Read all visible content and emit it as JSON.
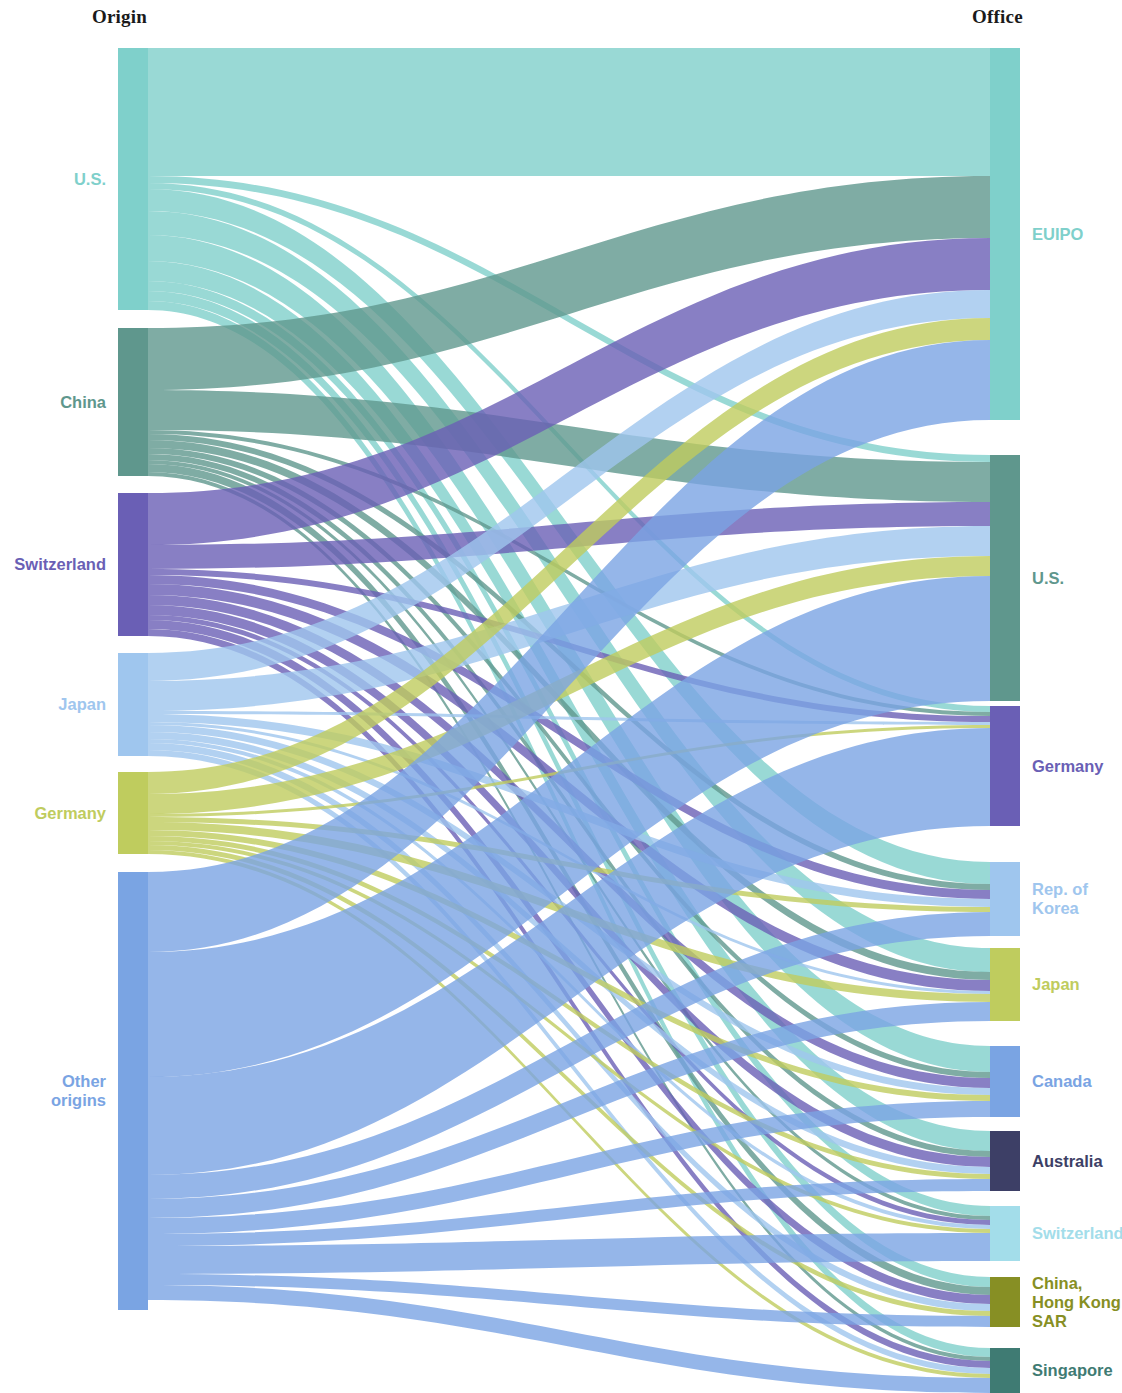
{
  "headers": {
    "left": "Origin",
    "right": "Office"
  },
  "palette": {
    "teal": "#7fd0cb",
    "green_teal": "#5f978d",
    "purple": "#6a5fb5",
    "light_blue": "#9fc6ee",
    "olive": "#bfcc5e",
    "cornflower": "#7aa4e3",
    "navy": "#3d3f66",
    "cyan_light": "#a3ddea",
    "dark_olive": "#878f24",
    "dark_teal": "#3f7b73"
  },
  "chart_data": {
    "type": "sankey",
    "title": "",
    "xlabel": "Origin",
    "ylabel": "Office",
    "legend": "none",
    "grid": false,
    "nodes_left": [
      {
        "id": "o_us",
        "label": "U.S.",
        "color": "#7fd0cb",
        "value": 262,
        "y0": 48,
        "y1": 310
      },
      {
        "id": "o_cn",
        "label": "China",
        "color": "#5f978d",
        "value": 148,
        "y0": 328,
        "y1": 476
      },
      {
        "id": "o_ch",
        "label": "Switzerland",
        "color": "#6a5fb5",
        "value": 143,
        "y0": 493,
        "y1": 636
      },
      {
        "id": "o_jp",
        "label": "Japan",
        "color": "#9fc6ee",
        "value": 103,
        "y0": 653,
        "y1": 756
      },
      {
        "id": "o_de",
        "label": "Germany",
        "color": "#bfcc5e",
        "value": 82,
        "y0": 772,
        "y1": 854
      },
      {
        "id": "o_other",
        "label": "Other\norigins",
        "color": "#7aa4e3",
        "value": 438,
        "y0": 872,
        "y1": 1310
      }
    ],
    "nodes_right": [
      {
        "id": "d_euipo",
        "label": "EUIPO",
        "color": "#7fd0cb",
        "value": 372,
        "y0": 48,
        "y1": 420
      },
      {
        "id": "d_us",
        "label": "U.S.",
        "color": "#5f978d",
        "value": 246,
        "y0": 455,
        "y1": 701
      },
      {
        "id": "d_de",
        "label": "Germany",
        "color": "#6a5fb5",
        "value": 120,
        "y0": 706,
        "y1": 826
      },
      {
        "id": "d_kr",
        "label": "Rep. of\nKorea",
        "color": "#9fc6ee",
        "value": 74,
        "y0": 862,
        "y1": 936
      },
      {
        "id": "d_jp",
        "label": "Japan",
        "color": "#bfcc5e",
        "value": 73,
        "y0": 948,
        "y1": 1021
      },
      {
        "id": "d_ca",
        "label": "Canada",
        "color": "#7aa4e3",
        "value": 71,
        "y0": 1046,
        "y1": 1117
      },
      {
        "id": "d_au",
        "label": "Australia",
        "color": "#3d3f66",
        "value": 60,
        "y0": 1131,
        "y1": 1191
      },
      {
        "id": "d_ch",
        "label": "Switzerland",
        "color": "#a3ddea",
        "value": 55,
        "y0": 1206,
        "y1": 1261
      },
      {
        "id": "d_hk",
        "label": "China,\nHong Kong\nSAR",
        "color": "#878f24",
        "value": 50,
        "y0": 1277,
        "y1": 1327
      },
      {
        "id": "d_sg",
        "label": "Singapore",
        "color": "#3f7b73",
        "value": 45,
        "y0": 1348,
        "y1": 1393
      }
    ],
    "links": [
      {
        "source": "o_us",
        "target": "d_euipo",
        "value": 128,
        "color": "#7fd0cb"
      },
      {
        "source": "o_us",
        "target": "d_us",
        "value": 7,
        "color": "#7fd0cb"
      },
      {
        "source": "o_us",
        "target": "d_de",
        "value": 6,
        "color": "#7fd0cb"
      },
      {
        "source": "o_us",
        "target": "d_kr",
        "value": 22,
        "color": "#7fd0cb"
      },
      {
        "source": "o_us",
        "target": "d_jp",
        "value": 24,
        "color": "#7fd0cb"
      },
      {
        "source": "o_us",
        "target": "d_ca",
        "value": 26,
        "color": "#7fd0cb"
      },
      {
        "source": "o_us",
        "target": "d_au",
        "value": 20,
        "color": "#7fd0cb"
      },
      {
        "source": "o_us",
        "target": "d_ch",
        "value": 10,
        "color": "#7fd0cb"
      },
      {
        "source": "o_us",
        "target": "d_hk",
        "value": 10,
        "color": "#7fd0cb"
      },
      {
        "source": "o_us",
        "target": "d_sg",
        "value": 9,
        "color": "#7fd0cb"
      },
      {
        "source": "o_cn",
        "target": "d_euipo",
        "value": 62,
        "color": "#5f978d"
      },
      {
        "source": "o_cn",
        "target": "d_us",
        "value": 40,
        "color": "#5f978d"
      },
      {
        "source": "o_cn",
        "target": "d_de",
        "value": 4,
        "color": "#5f978d"
      },
      {
        "source": "o_cn",
        "target": "d_kr",
        "value": 6,
        "color": "#5f978d"
      },
      {
        "source": "o_cn",
        "target": "d_jp",
        "value": 8,
        "color": "#5f978d"
      },
      {
        "source": "o_cn",
        "target": "d_ca",
        "value": 6,
        "color": "#5f978d"
      },
      {
        "source": "o_cn",
        "target": "d_au",
        "value": 6,
        "color": "#5f978d"
      },
      {
        "source": "o_cn",
        "target": "d_ch",
        "value": 4,
        "color": "#5f978d"
      },
      {
        "source": "o_cn",
        "target": "d_hk",
        "value": 8,
        "color": "#5f978d"
      },
      {
        "source": "o_cn",
        "target": "d_sg",
        "value": 4,
        "color": "#5f978d"
      },
      {
        "source": "o_ch",
        "target": "d_euipo",
        "value": 52,
        "color": "#6a5fb5"
      },
      {
        "source": "o_ch",
        "target": "d_us",
        "value": 24,
        "color": "#6a5fb5"
      },
      {
        "source": "o_ch",
        "target": "d_de",
        "value": 6,
        "color": "#6a5fb5"
      },
      {
        "source": "o_ch",
        "target": "d_kr",
        "value": 9,
        "color": "#6a5fb5"
      },
      {
        "source": "o_ch",
        "target": "d_jp",
        "value": 11,
        "color": "#6a5fb5"
      },
      {
        "source": "o_ch",
        "target": "d_ca",
        "value": 10,
        "color": "#6a5fb5"
      },
      {
        "source": "o_ch",
        "target": "d_au",
        "value": 10,
        "color": "#6a5fb5"
      },
      {
        "source": "o_ch",
        "target": "d_ch",
        "value": 5,
        "color": "#6a5fb5"
      },
      {
        "source": "o_ch",
        "target": "d_hk",
        "value": 9,
        "color": "#6a5fb5"
      },
      {
        "source": "o_ch",
        "target": "d_sg",
        "value": 7,
        "color": "#6a5fb5"
      },
      {
        "source": "o_jp",
        "target": "d_euipo",
        "value": 28,
        "color": "#9fc6ee"
      },
      {
        "source": "o_jp",
        "target": "d_us",
        "value": 30,
        "color": "#9fc6ee"
      },
      {
        "source": "o_jp",
        "target": "d_de",
        "value": 3,
        "color": "#9fc6ee"
      },
      {
        "source": "o_jp",
        "target": "d_kr",
        "value": 8,
        "color": "#9fc6ee"
      },
      {
        "source": "o_jp",
        "target": "d_jp",
        "value": 3,
        "color": "#9fc6ee"
      },
      {
        "source": "o_jp",
        "target": "d_ca",
        "value": 7,
        "color": "#9fc6ee"
      },
      {
        "source": "o_jp",
        "target": "d_au",
        "value": 7,
        "color": "#9fc6ee"
      },
      {
        "source": "o_jp",
        "target": "d_ch",
        "value": 4,
        "color": "#9fc6ee"
      },
      {
        "source": "o_jp",
        "target": "d_hk",
        "value": 7,
        "color": "#9fc6ee"
      },
      {
        "source": "o_jp",
        "target": "d_sg",
        "value": 6,
        "color": "#9fc6ee"
      },
      {
        "source": "o_de",
        "target": "d_euipo",
        "value": 22,
        "color": "#bfcc5e"
      },
      {
        "source": "o_de",
        "target": "d_us",
        "value": 20,
        "color": "#bfcc5e"
      },
      {
        "source": "o_de",
        "target": "d_de",
        "value": 3,
        "color": "#bfcc5e"
      },
      {
        "source": "o_de",
        "target": "d_kr",
        "value": 5,
        "color": "#bfcc5e"
      },
      {
        "source": "o_de",
        "target": "d_jp",
        "value": 8,
        "color": "#bfcc5e"
      },
      {
        "source": "o_de",
        "target": "d_ca",
        "value": 6,
        "color": "#bfcc5e"
      },
      {
        "source": "o_de",
        "target": "d_au",
        "value": 5,
        "color": "#bfcc5e"
      },
      {
        "source": "o_de",
        "target": "d_ch",
        "value": 4,
        "color": "#bfcc5e"
      },
      {
        "source": "o_de",
        "target": "d_hk",
        "value": 5,
        "color": "#bfcc5e"
      },
      {
        "source": "o_de",
        "target": "d_sg",
        "value": 4,
        "color": "#bfcc5e"
      },
      {
        "source": "o_other",
        "target": "d_euipo",
        "value": 80,
        "color": "#7aa4e3"
      },
      {
        "source": "o_other",
        "target": "d_us",
        "value": 125,
        "color": "#7aa4e3"
      },
      {
        "source": "o_other",
        "target": "d_de",
        "value": 98,
        "color": "#7aa4e3"
      },
      {
        "source": "o_other",
        "target": "d_kr",
        "value": 24,
        "color": "#7aa4e3"
      },
      {
        "source": "o_other",
        "target": "d_jp",
        "value": 19,
        "color": "#7aa4e3"
      },
      {
        "source": "o_other",
        "target": "d_ca",
        "value": 16,
        "color": "#7aa4e3"
      },
      {
        "source": "o_other",
        "target": "d_au",
        "value": 12,
        "color": "#7aa4e3"
      },
      {
        "source": "o_other",
        "target": "d_ch",
        "value": 28,
        "color": "#7aa4e3"
      },
      {
        "source": "o_other",
        "target": "d_hk",
        "value": 11,
        "color": "#7aa4e3"
      },
      {
        "source": "o_other",
        "target": "d_sg",
        "value": 15,
        "color": "#7aa4e3"
      }
    ],
    "layout": {
      "left_node_x": 118,
      "left_node_w": 30,
      "right_node_x": 990,
      "right_node_w": 30,
      "canvas_w": 1122,
      "canvas_h": 1393
    }
  }
}
